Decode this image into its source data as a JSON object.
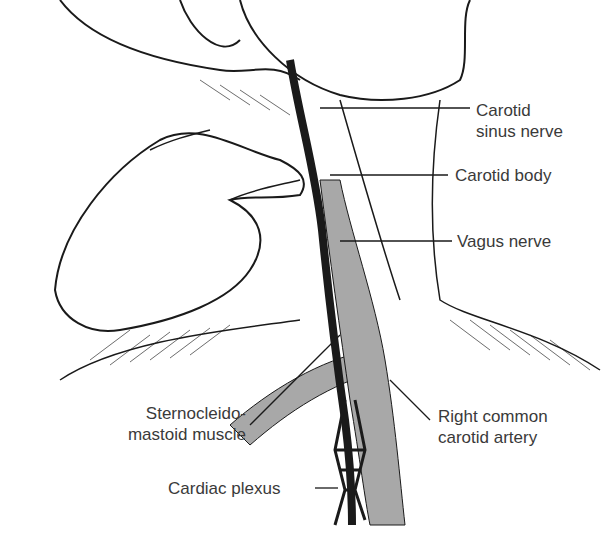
{
  "figure": {
    "labels": {
      "carotid_sinus_nerve_1": "Carotid",
      "carotid_sinus_nerve_2": "sinus nerve",
      "carotid_body": "Carotid body",
      "vagus_nerve": "Vagus nerve",
      "scm_1": "Sternocleido-",
      "scm_2": "mastoid muscle",
      "rcca_1": "Right common",
      "rcca_2": "carotid artery",
      "cardiac_plexus": "Cardiac plexus"
    },
    "colors": {
      "ink": "#1a1a1a",
      "shade": "#a8a8a8",
      "text": "#3a3a3a"
    }
  }
}
